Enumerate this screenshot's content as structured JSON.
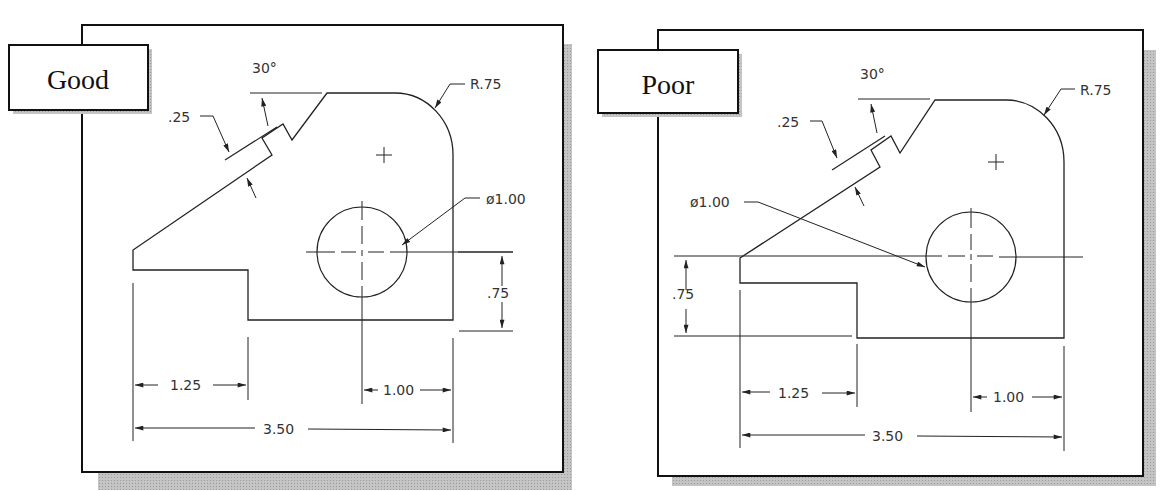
{
  "panels": [
    {
      "label": "Good",
      "dimensions": {
        "angle": "30°",
        "slot_width": ".25",
        "radius": "R.75",
        "diameter": "ø1.00",
        "height": ".75",
        "step_width": "1.25",
        "hole_offset": "1.00",
        "overall_width": "3.50"
      }
    },
    {
      "label": "Poor",
      "dimensions": {
        "angle": "30°",
        "slot_width": ".25",
        "radius": "R.75",
        "diameter": "ø1.00",
        "height": ".75",
        "step_width": "1.25",
        "hole_offset": "1.00",
        "overall_width": "3.50"
      }
    }
  ],
  "colors": {
    "line": "#222222",
    "frame": "#111111",
    "shadow": "#b8b8b8",
    "background": "#ffffff"
  }
}
